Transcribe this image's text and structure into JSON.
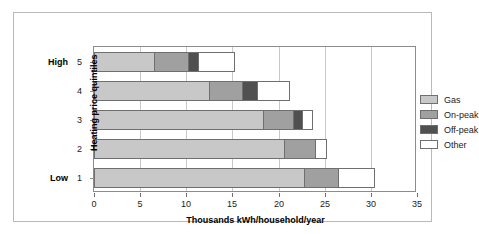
{
  "chart_data": {
    "type": "bar",
    "orientation": "horizontal",
    "stacked": true,
    "title": "",
    "xlabel": "Thousands kWh/household/year",
    "ylabel": "Heating price quintiles",
    "xlim": [
      0,
      35
    ],
    "xticks": [
      0,
      5,
      10,
      15,
      20,
      25,
      30,
      35
    ],
    "grid": true,
    "grid_axis": "x",
    "legend_position": "right-top",
    "categories": [
      "1",
      "2",
      "3",
      "4",
      "5"
    ],
    "category_end_labels": {
      "low": "Low",
      "high": "High"
    },
    "series": [
      {
        "name": "Gas",
        "color": "#c8c8c8",
        "values": [
          22.8,
          20.6,
          18.3,
          12.5,
          6.5
        ]
      },
      {
        "name": "On-peak",
        "color": "#a0a0a0",
        "values": [
          3.6,
          3.4,
          3.3,
          3.5,
          3.7
        ]
      },
      {
        "name": "Off-peak",
        "color": "#505050",
        "values": [
          0.0,
          0.0,
          0.9,
          1.7,
          1.1
        ]
      },
      {
        "name": "Other",
        "color": "#ffffff",
        "values": [
          4.0,
          1.2,
          1.2,
          3.5,
          4.0
        ]
      }
    ],
    "bar_totals": [
      30.4,
      25.2,
      23.7,
      21.2,
      15.3
    ]
  },
  "legend": {
    "items": [
      {
        "label": "Gas"
      },
      {
        "label": "On-peak"
      },
      {
        "label": "Off-peak"
      },
      {
        "label": "Other"
      }
    ]
  },
  "axes": {
    "y_title": "Heating price quintiles",
    "x_title": "Thousands kWh/household/year",
    "y_labels": [
      {
        "num": "5",
        "extreme": "High"
      },
      {
        "num": "4",
        "extreme": ""
      },
      {
        "num": "3",
        "extreme": ""
      },
      {
        "num": "2",
        "extreme": ""
      },
      {
        "num": "1",
        "extreme": "Low"
      }
    ],
    "x_labels": [
      "0",
      "5",
      "10",
      "15",
      "20",
      "25",
      "30",
      "35"
    ]
  }
}
